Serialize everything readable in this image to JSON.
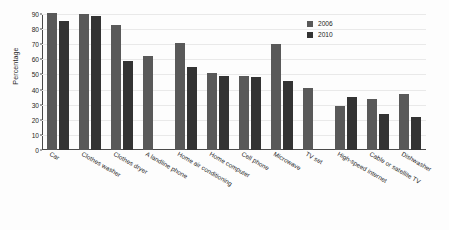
{
  "chart_data": {
    "type": "bar",
    "title": "",
    "xlabel": "",
    "ylabel": "Percentage",
    "ylim": [
      0,
      90
    ],
    "ytick_step": 10,
    "yticks": [
      0,
      10,
      20,
      30,
      40,
      50,
      60,
      70,
      80,
      90
    ],
    "grid": true,
    "legend_position": "top-right",
    "categories": [
      "Car",
      "Clothes washer",
      "Clothes dryer",
      "A landline phone",
      "Home air conditioning",
      "Home computer",
      "Cell phone",
      "Microwave",
      "TV set",
      "High-speed internet",
      "Cable or satellite TV",
      "Dishwasher"
    ],
    "series": [
      {
        "name": "2006",
        "color": "#595959",
        "values": [
          91,
          90,
          83,
          62,
          71,
          51,
          49,
          70,
          41,
          29,
          34,
          37
        ]
      },
      {
        "name": "2010",
        "color": "#333333",
        "values": [
          85.5,
          89,
          59,
          null,
          55,
          49,
          48,
          46,
          null,
          35,
          24,
          22
        ]
      }
    ]
  },
  "legend": {
    "items": [
      {
        "label": "2006",
        "series_key": "s2006"
      },
      {
        "label": "2010",
        "series_key": "s2010"
      }
    ]
  },
  "axis": {
    "y_title": "Percentage"
  }
}
